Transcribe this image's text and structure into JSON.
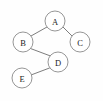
{
  "diagram": {
    "type": "tree-graph",
    "canvas": {
      "width": 103,
      "height": 101,
      "background": "#fefefe"
    },
    "style": {
      "node_fill": "#ffffff",
      "node_stroke": "#8a8a8a",
      "edge_stroke": "#6e6e6e",
      "label_color": "#1c1c1c",
      "node_radius": 10
    },
    "nodes": [
      {
        "id": "A",
        "label": "A",
        "cx": 55,
        "cy": 21,
        "r": 10
      },
      {
        "id": "B",
        "label": "B",
        "cx": 23,
        "cy": 42,
        "r": 10
      },
      {
        "id": "C",
        "label": "C",
        "cx": 80,
        "cy": 42,
        "r": 10
      },
      {
        "id": "D",
        "label": "D",
        "cx": 58,
        "cy": 62,
        "r": 10
      },
      {
        "id": "E",
        "label": "E",
        "cx": 22,
        "cy": 78,
        "r": 10
      }
    ],
    "edges": [
      {
        "id": "A-B",
        "from": "A",
        "to": "B",
        "x1": 47.0,
        "y1": 27.0,
        "x2": 31.0,
        "y2": 36.0
      },
      {
        "id": "A-C",
        "from": "A",
        "to": "C",
        "x1": 63.0,
        "y1": 27.0,
        "x2": 72.0,
        "y2": 36.0
      },
      {
        "id": "B-D",
        "from": "B",
        "to": "D",
        "x1": 30.5,
        "y1": 48.5,
        "x2": 50.5,
        "y2": 56.0
      },
      {
        "id": "D-E",
        "from": "D",
        "to": "E",
        "x1": 49.5,
        "y1": 68.0,
        "x2": 31.0,
        "y2": 75.0
      }
    ]
  }
}
